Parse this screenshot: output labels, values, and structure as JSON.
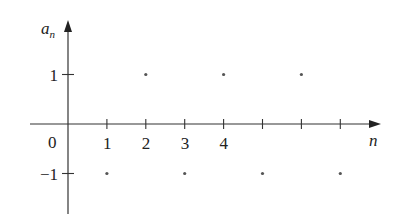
{
  "chart_data": {
    "type": "scatter",
    "title": "",
    "xlabel": "n",
    "ylabel": "a_n",
    "origin_label": "0",
    "x_tick_labels": [
      "1",
      "2",
      "3",
      "4"
    ],
    "x_ticks": [
      1,
      2,
      3,
      4,
      5,
      6,
      7
    ],
    "y_tick_labels": [
      "1",
      "−1"
    ],
    "y_ticks": [
      1,
      -1
    ],
    "series": [
      {
        "name": "a_n",
        "x": [
          1,
          2,
          3,
          4,
          5,
          6,
          7
        ],
        "values": [
          -1,
          1,
          -1,
          1,
          -1,
          1,
          -1
        ]
      }
    ],
    "xlim": [
      -1,
      8
    ],
    "ylim": [
      -1.8,
      2
    ],
    "grid": false,
    "legend": "none",
    "colors": {
      "axis": "#333333",
      "point": "#555555"
    }
  }
}
